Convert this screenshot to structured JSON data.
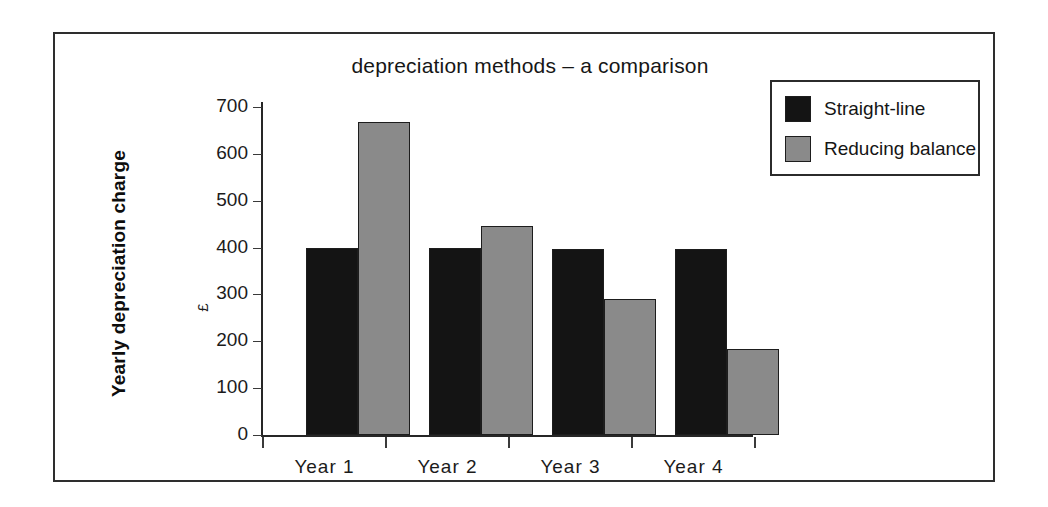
{
  "figure": {
    "border_color": "#2e2e2e",
    "background": "#ffffff"
  },
  "chart_data": {
    "type": "bar",
    "title": "depreciation methods – a comparison",
    "xlabel": "",
    "ylabel": "Yearly depreciation charge",
    "yunit": "£",
    "categories": [
      "Year  1",
      "Year  2",
      "Year  3",
      "Year  4"
    ],
    "series": [
      {
        "name": "Straight-line",
        "color": "#141414",
        "values": [
          400,
          400,
          398,
          398
        ]
      },
      {
        "name": "Reducing balance",
        "color": "#8a8a8a",
        "values": [
          667,
          446,
          290,
          183
        ]
      }
    ],
    "ylim": [
      0,
      700
    ],
    "yticks": [
      0,
      100,
      200,
      300,
      400,
      500,
      600,
      700
    ],
    "ytick_labels": [
      "0",
      "100",
      "200",
      "300",
      "400",
      "500",
      "600",
      "700"
    ],
    "grid": false,
    "legend_position": "top-right"
  },
  "legend": {
    "entries": [
      {
        "label": "Straight-line",
        "color": "#141414"
      },
      {
        "label": "Reducing balance",
        "color": "#8a8a8a"
      }
    ]
  }
}
